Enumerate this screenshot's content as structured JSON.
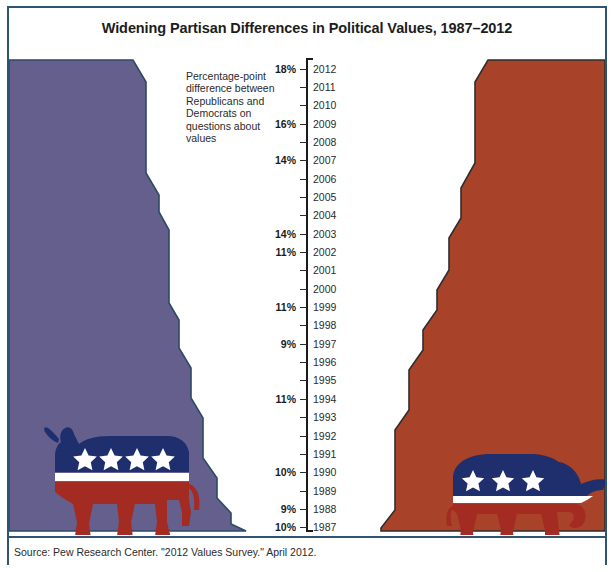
{
  "title": "Widening Partisan Differences in Political Values, 1987–2012",
  "annotation": "Percentage-point difference between Republicans and Democrats on questions about values",
  "source": "Source: Pew Research Center. \"2012 Values Survey.\" April 2012.",
  "colors": {
    "democrat_fill": "#645f8c",
    "republican_fill": "#a8432a",
    "frame_border": "#2e5472",
    "axis": "#1b1b1b",
    "logo_blue": "#1f2f6e",
    "logo_red": "#a32b22",
    "logo_white": "#ffffff",
    "background": "#ffffff"
  },
  "legend": {
    "left_symbol": "democratic-donkey",
    "right_symbol": "republican-elephant"
  },
  "chart_data": {
    "type": "area",
    "title": "Widening Partisan Differences in Political Values, 1987–2012",
    "subtitle": "Percentage-point difference between Republicans and Democrats on questions about values",
    "xlabel": "",
    "ylabel": "Year",
    "orientation": "vertical-mirrored",
    "axis_direction": "year increases upward",
    "grid": false,
    "legend_position": "none",
    "categories": [
      1987,
      1988,
      1989,
      1990,
      1991,
      1992,
      1993,
      1994,
      1995,
      1996,
      1997,
      1998,
      1999,
      2000,
      2001,
      2002,
      2003,
      2004,
      2005,
      2006,
      2007,
      2008,
      2009,
      2010,
      2011,
      2012
    ],
    "value_unit": "percentage points",
    "labeled_values": {
      "1987": 10,
      "1988": 9,
      "1990": 10,
      "1994": 11,
      "1997": 9,
      "1999": 11,
      "2002": 11,
      "2003": 14,
      "2007": 14,
      "2009": 16,
      "2012": 18
    },
    "values": [
      10,
      9,
      10,
      10,
      10,
      10,
      11,
      11,
      10,
      10,
      9,
      10,
      11,
      11,
      11,
      11,
      14,
      14,
      14,
      14,
      14,
      15,
      16,
      17,
      17,
      18
    ],
    "series": [
      {
        "name": "Democrats",
        "side": "left",
        "color": "#645f8c",
        "symbol": "donkey"
      },
      {
        "name": "Republicans",
        "side": "right",
        "color": "#a8432a",
        "symbol": "elephant"
      }
    ]
  },
  "axis": {
    "years": [
      "2012",
      "2011",
      "2010",
      "2009",
      "2008",
      "2007",
      "2006",
      "2005",
      "2004",
      "2003",
      "2002",
      "2001",
      "2000",
      "1999",
      "1998",
      "1997",
      "1996",
      "1995",
      "1994",
      "1993",
      "1992",
      "1991",
      "1990",
      "1989",
      "1988",
      "1987"
    ],
    "percent_labels": [
      {
        "year": "2012",
        "value": "18%"
      },
      {
        "year": "2011",
        "value": ""
      },
      {
        "year": "2010",
        "value": ""
      },
      {
        "year": "2009",
        "value": "16%"
      },
      {
        "year": "2008",
        "value": ""
      },
      {
        "year": "2007",
        "value": "14%"
      },
      {
        "year": "2006",
        "value": ""
      },
      {
        "year": "2005",
        "value": ""
      },
      {
        "year": "2004",
        "value": ""
      },
      {
        "year": "2003",
        "value": "14%"
      },
      {
        "year": "2002",
        "value": "11%"
      },
      {
        "year": "2001",
        "value": ""
      },
      {
        "year": "2000",
        "value": ""
      },
      {
        "year": "1999",
        "value": "11%"
      },
      {
        "year": "1998",
        "value": ""
      },
      {
        "year": "1997",
        "value": "9%"
      },
      {
        "year": "1996",
        "value": ""
      },
      {
        "year": "1995",
        "value": ""
      },
      {
        "year": "1994",
        "value": "11%"
      },
      {
        "year": "1993",
        "value": ""
      },
      {
        "year": "1992",
        "value": ""
      },
      {
        "year": "1991",
        "value": ""
      },
      {
        "year": "1990",
        "value": "10%"
      },
      {
        "year": "1989",
        "value": ""
      },
      {
        "year": "1988",
        "value": "9%"
      },
      {
        "year": "1987",
        "value": "10%"
      }
    ]
  }
}
